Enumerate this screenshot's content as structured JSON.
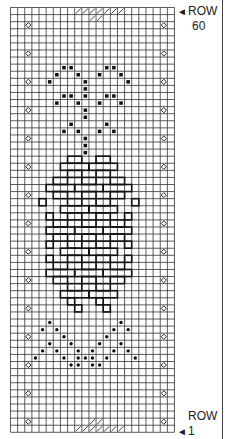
{
  "chart": {
    "cols": 23,
    "rows": 60,
    "cell_w": 7.13,
    "cell_h": 7.08,
    "colors": {
      "grid": "#333333",
      "ink": "#111111",
      "bg": "#ffffff"
    },
    "labels": {
      "top_row_word": "ROW",
      "top_row_num": "60",
      "bottom_row_word": "ROW",
      "bottom_row_num": "1",
      "arrow": "◄"
    },
    "legend_symbols": [
      "diamond-open",
      "square-filled",
      "dot-filled",
      "hatched-cell",
      "bold-outline"
    ],
    "diamond_cols": [
      2,
      21
    ],
    "diamond_rows": [
      2,
      6,
      10,
      14,
      18,
      22,
      26,
      30,
      34,
      38,
      42,
      46,
      50,
      54,
      58
    ],
    "hatch_top": {
      "row": 0,
      "cells": [
        [
          0,
          9
        ],
        [
          0,
          10
        ],
        [
          0,
          11
        ],
        [
          0,
          12
        ],
        [
          0,
          13
        ],
        [
          0,
          14
        ],
        [
          0,
          15
        ],
        [
          1,
          11
        ],
        [
          1,
          12
        ]
      ]
    },
    "hatch_bottom": {
      "row": 59,
      "cells": [
        [
          59,
          9
        ],
        [
          59,
          10
        ],
        [
          59,
          11
        ],
        [
          59,
          12
        ],
        [
          59,
          13
        ],
        [
          59,
          14
        ],
        [
          59,
          15
        ],
        [
          58,
          11
        ],
        [
          58,
          12
        ]
      ]
    },
    "squares": [
      [
        8,
        7
      ],
      [
        8,
        8
      ],
      [
        8,
        13
      ],
      [
        8,
        14
      ],
      [
        9,
        6
      ],
      [
        9,
        9
      ],
      [
        9,
        12
      ],
      [
        9,
        15
      ],
      [
        10,
        5
      ],
      [
        10,
        10
      ],
      [
        10,
        16
      ],
      [
        11,
        10
      ],
      [
        12,
        10
      ],
      [
        12,
        7
      ],
      [
        12,
        8
      ],
      [
        12,
        13
      ],
      [
        12,
        14
      ],
      [
        13,
        6
      ],
      [
        13,
        9
      ],
      [
        13,
        12
      ],
      [
        13,
        15
      ],
      [
        14,
        10
      ],
      [
        15,
        10
      ],
      [
        16,
        8
      ],
      [
        16,
        13
      ],
      [
        17,
        7
      ],
      [
        17,
        9
      ],
      [
        17,
        12
      ],
      [
        17,
        14
      ],
      [
        18,
        10
      ],
      [
        19,
        10
      ],
      [
        20,
        10
      ]
    ],
    "dots": [
      [
        44,
        5
      ],
      [
        44,
        15
      ],
      [
        45,
        4
      ],
      [
        45,
        6
      ],
      [
        45,
        14
      ],
      [
        45,
        16
      ],
      [
        46,
        7
      ],
      [
        46,
        13
      ],
      [
        47,
        5
      ],
      [
        47,
        8
      ],
      [
        47,
        12
      ],
      [
        47,
        15
      ],
      [
        48,
        4
      ],
      [
        48,
        6
      ],
      [
        48,
        9
      ],
      [
        48,
        11
      ],
      [
        48,
        14
      ],
      [
        48,
        16
      ],
      [
        49,
        3
      ],
      [
        49,
        7
      ],
      [
        49,
        10
      ],
      [
        49,
        13
      ],
      [
        49,
        17
      ],
      [
        50,
        8
      ],
      [
        50,
        9
      ],
      [
        50,
        11
      ],
      [
        50,
        12
      ],
      [
        49,
        9
      ],
      [
        49,
        11
      ]
    ],
    "outline_blocks": [
      {
        "r": 21,
        "c": 8,
        "w": 2,
        "h": 1
      },
      {
        "r": 21,
        "c": 12,
        "w": 2,
        "h": 1
      },
      {
        "r": 22,
        "c": 7,
        "w": 4,
        "h": 1
      },
      {
        "r": 22,
        "c": 11,
        "w": 4,
        "h": 1
      },
      {
        "r": 23,
        "c": 8,
        "w": 2,
        "h": 1
      },
      {
        "r": 23,
        "c": 12,
        "w": 2,
        "h": 1
      },
      {
        "r": 24,
        "c": 6,
        "w": 2,
        "h": 1
      },
      {
        "r": 24,
        "c": 10,
        "w": 2,
        "h": 1
      },
      {
        "r": 24,
        "c": 14,
        "w": 2,
        "h": 1
      },
      {
        "r": 25,
        "c": 5,
        "w": 4,
        "h": 1
      },
      {
        "r": 25,
        "c": 9,
        "w": 4,
        "h": 1
      },
      {
        "r": 25,
        "c": 13,
        "w": 4,
        "h": 1
      },
      {
        "r": 26,
        "c": 6,
        "w": 2,
        "h": 1
      },
      {
        "r": 26,
        "c": 10,
        "w": 2,
        "h": 1
      },
      {
        "r": 26,
        "c": 14,
        "w": 2,
        "h": 1
      },
      {
        "r": 27,
        "c": 4,
        "w": 1,
        "h": 1
      },
      {
        "r": 27,
        "c": 8,
        "w": 2,
        "h": 1
      },
      {
        "r": 27,
        "c": 12,
        "w": 2,
        "h": 1
      },
      {
        "r": 27,
        "c": 17,
        "w": 1,
        "h": 1
      },
      {
        "r": 28,
        "c": 7,
        "w": 4,
        "h": 1
      },
      {
        "r": 28,
        "c": 11,
        "w": 4,
        "h": 1
      },
      {
        "r": 29,
        "c": 5,
        "w": 1,
        "h": 1
      },
      {
        "r": 29,
        "c": 8,
        "w": 2,
        "h": 1
      },
      {
        "r": 29,
        "c": 12,
        "w": 2,
        "h": 1
      },
      {
        "r": 29,
        "c": 16,
        "w": 1,
        "h": 1
      },
      {
        "r": 30,
        "c": 6,
        "w": 2,
        "h": 1
      },
      {
        "r": 30,
        "c": 10,
        "w": 2,
        "h": 1
      },
      {
        "r": 30,
        "c": 14,
        "w": 2,
        "h": 1
      },
      {
        "r": 31,
        "c": 5,
        "w": 4,
        "h": 1
      },
      {
        "r": 31,
        "c": 9,
        "w": 4,
        "h": 1
      },
      {
        "r": 31,
        "c": 13,
        "w": 4,
        "h": 1
      },
      {
        "r": 32,
        "c": 6,
        "w": 2,
        "h": 1
      },
      {
        "r": 32,
        "c": 10,
        "w": 2,
        "h": 1
      },
      {
        "r": 32,
        "c": 14,
        "w": 2,
        "h": 1
      },
      {
        "r": 33,
        "c": 5,
        "w": 1,
        "h": 1
      },
      {
        "r": 33,
        "c": 8,
        "w": 2,
        "h": 1
      },
      {
        "r": 33,
        "c": 12,
        "w": 2,
        "h": 1
      },
      {
        "r": 33,
        "c": 16,
        "w": 1,
        "h": 1
      },
      {
        "r": 34,
        "c": 7,
        "w": 4,
        "h": 1
      },
      {
        "r": 34,
        "c": 11,
        "w": 4,
        "h": 1
      },
      {
        "r": 35,
        "c": 5,
        "w": 1,
        "h": 1
      },
      {
        "r": 35,
        "c": 8,
        "w": 2,
        "h": 1
      },
      {
        "r": 35,
        "c": 12,
        "w": 2,
        "h": 1
      },
      {
        "r": 35,
        "c": 16,
        "w": 1,
        "h": 1
      },
      {
        "r": 36,
        "c": 6,
        "w": 2,
        "h": 1
      },
      {
        "r": 36,
        "c": 10,
        "w": 2,
        "h": 1
      },
      {
        "r": 36,
        "c": 14,
        "w": 2,
        "h": 1
      },
      {
        "r": 37,
        "c": 5,
        "w": 4,
        "h": 1
      },
      {
        "r": 37,
        "c": 9,
        "w": 4,
        "h": 1
      },
      {
        "r": 37,
        "c": 13,
        "w": 4,
        "h": 1
      },
      {
        "r": 38,
        "c": 6,
        "w": 2,
        "h": 1
      },
      {
        "r": 38,
        "c": 10,
        "w": 2,
        "h": 1
      },
      {
        "r": 38,
        "c": 14,
        "w": 2,
        "h": 1
      },
      {
        "r": 39,
        "c": 8,
        "w": 2,
        "h": 1
      },
      {
        "r": 39,
        "c": 12,
        "w": 2,
        "h": 1
      },
      {
        "r": 40,
        "c": 7,
        "w": 4,
        "h": 1
      },
      {
        "r": 40,
        "c": 11,
        "w": 4,
        "h": 1
      },
      {
        "r": 41,
        "c": 8,
        "w": 1,
        "h": 1
      },
      {
        "r": 41,
        "c": 12,
        "w": 1,
        "h": 1
      },
      {
        "r": 42,
        "c": 9,
        "w": 1,
        "h": 1
      },
      {
        "r": 42,
        "c": 13,
        "w": 1,
        "h": 1
      }
    ]
  }
}
